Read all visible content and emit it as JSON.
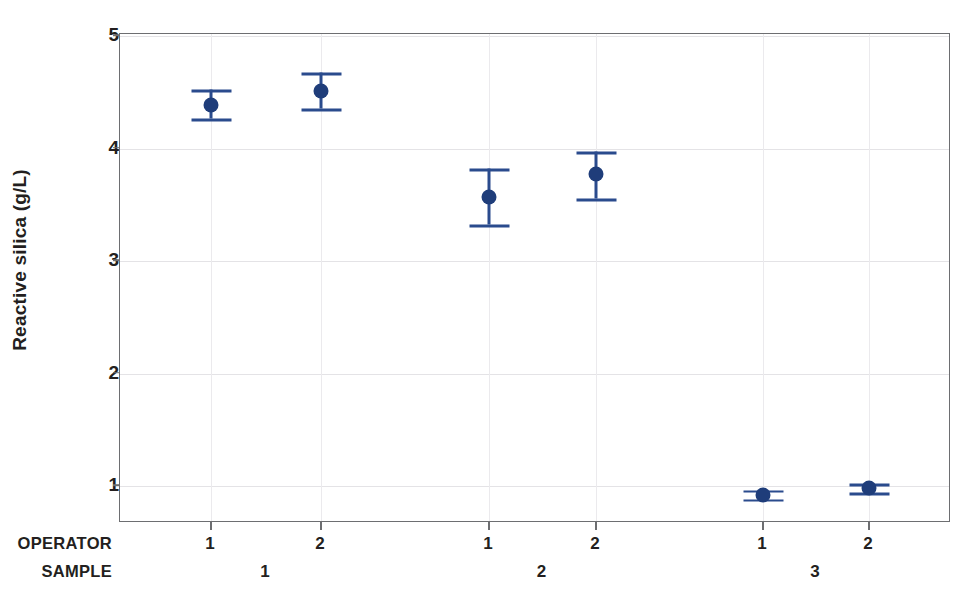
{
  "chart_data": {
    "type": "scatter",
    "title": "",
    "subtitle": "",
    "xlabel": "",
    "ylabel": "Reactive silica (g/L)",
    "ylim": [
      0.55,
      5.16
    ],
    "yticks": [
      1,
      2,
      3,
      4,
      5
    ],
    "ytick_labels": [
      "1",
      "2",
      "3",
      "4",
      "5"
    ],
    "grid": true,
    "grid_axis": "both",
    "legend": "none",
    "marker_color": "#1f3d7a",
    "errorbar_color": "#2a4b8d",
    "axis_color": "#6d6e71",
    "grid_color": "#e4e3e6",
    "text_color": "#231f20",
    "x_group_levels": [
      {
        "name": "OPERATOR",
        "label": "OPERATOR"
      },
      {
        "name": "SAMPLE",
        "label": "SAMPLE"
      }
    ],
    "points": [
      {
        "operator": "1",
        "sample": "1",
        "value": 4.39,
        "lower": 4.26,
        "upper": 4.52
      },
      {
        "operator": "2",
        "sample": "1",
        "value": 4.51,
        "lower": 4.35,
        "upper": 4.67
      },
      {
        "operator": "1",
        "sample": "2",
        "value": 3.57,
        "lower": 3.32,
        "upper": 3.82
      },
      {
        "operator": "2",
        "sample": "2",
        "value": 3.77,
        "lower": 3.55,
        "upper": 3.97
      },
      {
        "operator": "1",
        "sample": "3",
        "value": 0.92,
        "lower": 0.88,
        "upper": 0.96
      },
      {
        "operator": "2",
        "sample": "3",
        "value": 0.98,
        "lower": 0.94,
        "upper": 1.02
      }
    ],
    "operator_tick_labels": [
      "1",
      "2",
      "1",
      "2",
      "1",
      "2"
    ],
    "sample_tick_labels": [
      "1",
      "2",
      "3"
    ]
  },
  "axis": {
    "y_title": "Reactive silica (g/L)",
    "operator_row_label": "OPERATOR",
    "sample_row_label": "SAMPLE"
  }
}
